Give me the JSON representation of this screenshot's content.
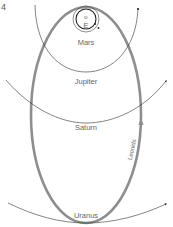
{
  "figure": {
    "number": "4",
    "labels": {
      "sun": "o",
      "earth": "E",
      "mars": "Mars",
      "jupiter": "Jupiter",
      "saturn": "Saturn",
      "uranus": "Uranus",
      "meteor_stream": "Leonids"
    },
    "colors": {
      "orbit_lines": "#333333",
      "leonids_orbit": "#8a8a8a",
      "label_text": "#666666"
    }
  }
}
